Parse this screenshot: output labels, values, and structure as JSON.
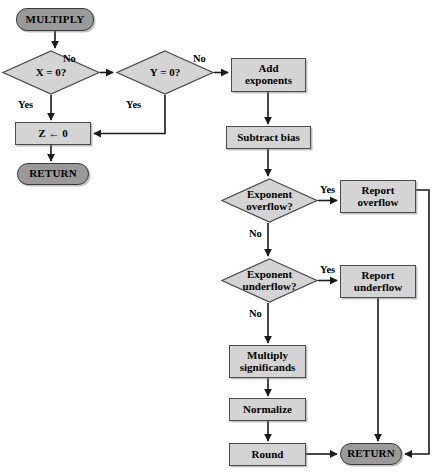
{
  "diagram": {
    "colors": {
      "terminal_fill": "#9a9a9a",
      "process_fill": "#d4d4d4",
      "decision_fill": "#d4d4d4",
      "stroke": "#3a3a3a",
      "background": "#ffffff"
    },
    "nodes": [
      {
        "id": "multiply",
        "type": "terminal",
        "label": "MULTIPLY",
        "x": 16,
        "y": 8,
        "w": 78,
        "h": 23
      },
      {
        "id": "x_is_zero",
        "type": "decision",
        "label": "X = 0?",
        "x": 2,
        "y": 50,
        "w": 98,
        "h": 45
      },
      {
        "id": "y_is_zero",
        "type": "decision",
        "label": "Y = 0?",
        "x": 116,
        "y": 50,
        "w": 98,
        "h": 45
      },
      {
        "id": "z_assign_zero",
        "type": "process",
        "label": "Z ← 0",
        "x": 15,
        "y": 122,
        "w": 76,
        "h": 23
      },
      {
        "id": "return_left",
        "type": "terminal",
        "label": "RETURN",
        "x": 17,
        "y": 163,
        "w": 72,
        "h": 22
      },
      {
        "id": "add_exponents",
        "type": "process",
        "label": "Add\nexponents",
        "x": 231,
        "y": 58,
        "w": 75,
        "h": 34
      },
      {
        "id": "subtract_bias",
        "type": "process",
        "label": "Subtract bias",
        "x": 226,
        "y": 126,
        "w": 85,
        "h": 23
      },
      {
        "id": "exp_overflow",
        "type": "decision",
        "label": "Exponent\noverflow?",
        "x": 221,
        "y": 178,
        "w": 97,
        "h": 45
      },
      {
        "id": "report_overflow",
        "type": "process",
        "label": "Report\noverflow",
        "x": 340,
        "y": 180,
        "w": 76,
        "h": 33
      },
      {
        "id": "exp_underflow",
        "type": "decision",
        "label": "Exponent\nunderflow?",
        "x": 221,
        "y": 258,
        "w": 97,
        "h": 45
      },
      {
        "id": "report_underflow",
        "type": "process",
        "label": "Report\nunderflow",
        "x": 340,
        "y": 265,
        "w": 76,
        "h": 33
      },
      {
        "id": "multiply_signif",
        "type": "process",
        "label": "Multiply\nsignificands",
        "x": 229,
        "y": 345,
        "w": 77,
        "h": 33
      },
      {
        "id": "normalize",
        "type": "process",
        "label": "Normalize",
        "x": 229,
        "y": 398,
        "w": 77,
        "h": 23
      },
      {
        "id": "round",
        "type": "process",
        "label": "Round",
        "x": 229,
        "y": 443,
        "w": 77,
        "h": 23
      },
      {
        "id": "return_right",
        "type": "terminal",
        "label": "RETURN",
        "x": 340,
        "y": 443,
        "w": 62,
        "h": 22
      }
    ],
    "edge_labels": [
      {
        "id": "x-no",
        "text": "No",
        "x": 63,
        "y": 53
      },
      {
        "id": "x-yes",
        "text": "Yes",
        "x": 18,
        "y": 99
      },
      {
        "id": "y-no",
        "text": "No",
        "x": 193,
        "y": 53
      },
      {
        "id": "y-yes",
        "text": "Yes",
        "x": 126,
        "y": 99
      },
      {
        "id": "overflow-yes",
        "text": "Yes",
        "x": 320,
        "y": 184
      },
      {
        "id": "overflow-no",
        "text": "No",
        "x": 249,
        "y": 228
      },
      {
        "id": "underflow-yes",
        "text": "Yes",
        "x": 320,
        "y": 264
      },
      {
        "id": "underflow-no",
        "text": "No",
        "x": 249,
        "y": 308
      }
    ],
    "edges": [
      {
        "id": "multiply-to-x",
        "from": "multiply",
        "to": "x_is_zero"
      },
      {
        "id": "x-no-to-y",
        "from": "x_is_zero",
        "to": "y_is_zero",
        "branch": "No"
      },
      {
        "id": "x-yes-to-z",
        "from": "x_is_zero",
        "to": "z_assign_zero",
        "branch": "Yes"
      },
      {
        "id": "y-yes-to-z",
        "from": "y_is_zero",
        "to": "z_assign_zero",
        "branch": "Yes"
      },
      {
        "id": "y-no-to-add-exponents",
        "from": "y_is_zero",
        "to": "add_exponents",
        "branch": "No"
      },
      {
        "id": "z-to-return-left",
        "from": "z_assign_zero",
        "to": "return_left"
      },
      {
        "id": "add-exponents-to-subtract",
        "from": "add_exponents",
        "to": "subtract_bias"
      },
      {
        "id": "subtract-to-overflow",
        "from": "subtract_bias",
        "to": "exp_overflow"
      },
      {
        "id": "overflow-yes-to-report",
        "from": "exp_overflow",
        "to": "report_overflow",
        "branch": "Yes"
      },
      {
        "id": "overflow-no-to-underflow",
        "from": "exp_overflow",
        "to": "exp_underflow",
        "branch": "No"
      },
      {
        "id": "underflow-yes-to-report",
        "from": "exp_underflow",
        "to": "report_underflow",
        "branch": "Yes"
      },
      {
        "id": "underflow-no-to-multiply",
        "from": "exp_underflow",
        "to": "multiply_signif",
        "branch": "No"
      },
      {
        "id": "multiply-to-normalize",
        "from": "multiply_signif",
        "to": "normalize"
      },
      {
        "id": "normalize-to-round",
        "from": "normalize",
        "to": "round"
      },
      {
        "id": "round-to-return-right",
        "from": "round",
        "to": "return_right"
      },
      {
        "id": "report-overflow-to-return",
        "from": "report_overflow",
        "to": "return_right"
      },
      {
        "id": "report-underflow-to-return",
        "from": "report_underflow",
        "to": "return_right"
      }
    ]
  }
}
